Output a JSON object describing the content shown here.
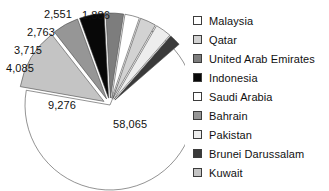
{
  "chart_data": {
    "type": "pie",
    "title": "",
    "legend_position": "right",
    "categories": [
      "Malaysia",
      "Qatar",
      "United Arab Emirates",
      "Indonesia",
      "Saudi Arabia",
      "Bahrain",
      "Pakistan",
      "Brunei Darussalam",
      "Kuwait"
    ],
    "values": [
      58065,
      2551,
      2763,
      3715,
      null,
      4085,
      null,
      1886,
      9276
    ],
    "value_labels": [
      "58,065",
      "2,551",
      "2,763",
      "3,715",
      "",
      "4,085",
      "",
      "1,886",
      "9,276"
    ],
    "colors": [
      "#ffffff",
      "#d2d2d2",
      "#7d7d7d",
      "#080808",
      "#ffffff",
      "#969696",
      "#ededed",
      "#3a3a3a",
      "#c4c4c4"
    ],
    "xlabel": "",
    "ylabel": ""
  },
  "labels": [
    {
      "text": "2,551",
      "x": 44,
      "y": 8
    },
    {
      "text": "1,886",
      "x": 82,
      "y": 9
    },
    {
      "text": "2,763",
      "x": 27,
      "y": 26
    },
    {
      "text": "3,715",
      "x": 14,
      "y": 44
    },
    {
      "text": "4,085",
      "x": 6,
      "y": 62
    },
    {
      "text": "9,276",
      "x": 48,
      "y": 99
    },
    {
      "text": "58,065",
      "x": 113,
      "y": 118
    }
  ],
  "legend": {
    "items": [
      {
        "label": "Malaysia",
        "color": "#ffffff"
      },
      {
        "label": "Qatar",
        "color": "#d2d2d2"
      },
      {
        "label": "United Arab Emirates",
        "color": "#7d7d7d"
      },
      {
        "label": "Indonesia",
        "color": "#080808"
      },
      {
        "label": "Saudi Arabia",
        "color": "#ffffff"
      },
      {
        "label": "Bahrain",
        "color": "#969696"
      },
      {
        "label": "Pakistan",
        "color": "#ededed"
      },
      {
        "label": "Brunei Darussalam",
        "color": "#3a3a3a"
      },
      {
        "label": "Kuwait",
        "color": "#c4c4c4"
      }
    ]
  },
  "geometry": {
    "cx": 110,
    "cy": 105,
    "r": 85,
    "explode": 7,
    "slices": [
      {
        "name": "Malaysia",
        "start": -68,
        "end": 190,
        "exploded": false,
        "color": "#ffffff"
      },
      {
        "name": "Kuwait",
        "start": 190,
        "end": 232,
        "exploded": true,
        "color": "#c4c4c4"
      },
      {
        "name": "Bahrain",
        "start": 232,
        "end": 250,
        "exploded": true,
        "color": "#969696"
      },
      {
        "name": "Indonesia",
        "start": 250,
        "end": 267,
        "exploded": true,
        "color": "#080808"
      },
      {
        "name": "United Arab Emirates",
        "start": 267,
        "end": 279,
        "exploded": true,
        "color": "#7d7d7d"
      },
      {
        "name": "Saudi Arabia",
        "start": 279,
        "end": 289,
        "exploded": true,
        "color": "#ffffff"
      },
      {
        "name": "Qatar",
        "start": 289,
        "end": 300,
        "exploded": true,
        "color": "#d2d2d2"
      },
      {
        "name": "Pakistan",
        "start": 300,
        "end": 311,
        "exploded": true,
        "color": "#ededed"
      },
      {
        "name": "Brunei Darussalam",
        "start": 311,
        "end": 319,
        "exploded": true,
        "color": "#3a3a3a"
      }
    ]
  }
}
